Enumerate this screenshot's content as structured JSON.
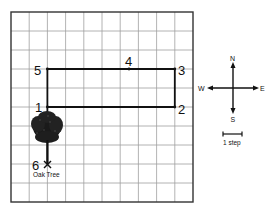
{
  "grid": {
    "columns": 10,
    "rows": 10,
    "left": 11,
    "top": 12,
    "right": 193,
    "bottom": 202,
    "line_color": "#9a9a9a",
    "border_color": "#333333"
  },
  "points": [
    {
      "label": "1",
      "x": 47,
      "y": 107,
      "lx": 35,
      "ly": 111
    },
    {
      "label": "2",
      "x": 175,
      "y": 107,
      "lx": 178,
      "ly": 114
    },
    {
      "label": "3",
      "x": 175,
      "y": 70,
      "lx": 178,
      "ly": 76
    },
    {
      "label": "4",
      "x": 129,
      "y": 70,
      "lx": 125,
      "ly": 66
    },
    {
      "label": "5",
      "x": 47,
      "y": 70,
      "lx": 34,
      "ly": 76
    },
    {
      "label": "6",
      "x": 47,
      "y": 164,
      "lx": 32,
      "ly": 169
    }
  ],
  "landmark": {
    "label": "Oak Tree",
    "x": 47,
    "y": 176
  },
  "compass": {
    "north": "N",
    "south": "S",
    "east": "E",
    "west": "W"
  },
  "scale": {
    "label": "1 step"
  }
}
